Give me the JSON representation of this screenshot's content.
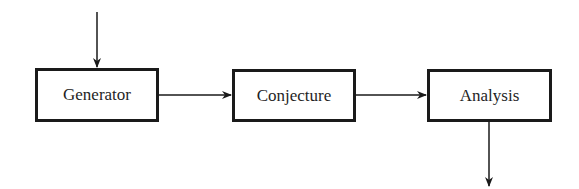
{
  "diagram": {
    "type": "flowchart",
    "direction": "left-to-right",
    "nodes": [
      {
        "id": "generator",
        "label": "Generator"
      },
      {
        "id": "conjecture",
        "label": "Conjecture"
      },
      {
        "id": "analysis",
        "label": "Analysis"
      }
    ],
    "edges": [
      {
        "from": "input",
        "to": "generator"
      },
      {
        "from": "generator",
        "to": "conjecture"
      },
      {
        "from": "conjecture",
        "to": "analysis"
      },
      {
        "from": "analysis",
        "to": "output"
      }
    ],
    "colors": {
      "stroke": "#1a1a1a",
      "text": "#1f1f1f",
      "background": "#ffffff"
    }
  }
}
